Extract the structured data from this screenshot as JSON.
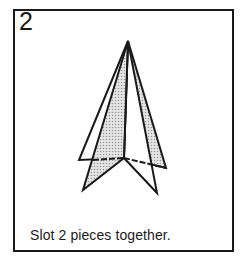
{
  "step": {
    "number": "2",
    "caption": "Slot 2 pieces together."
  },
  "diagram": {
    "colors": {
      "line": "#1a1a1a",
      "shade": "#c8c8c8",
      "paper": "#ffffff"
    }
  }
}
